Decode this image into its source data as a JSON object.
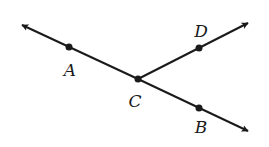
{
  "diagram": {
    "colors": {
      "stroke": "#1a1a1a",
      "background": "#ffffff"
    },
    "points": [
      {
        "id": "A",
        "label": "A",
        "x": 69,
        "y": 47,
        "label_x": 70,
        "label_y": 70
      },
      {
        "id": "C",
        "label": "C",
        "x": 138,
        "y": 79,
        "label_x": 135,
        "label_y": 101
      },
      {
        "id": "D",
        "label": "D",
        "x": 199,
        "y": 48,
        "label_x": 201,
        "label_y": 31
      },
      {
        "id": "B",
        "label": "B",
        "x": 199,
        "y": 108,
        "label_x": 201,
        "label_y": 127
      }
    ],
    "rays": [
      {
        "from": "C",
        "through": "A",
        "arrow_tip": [
          20,
          24
        ]
      },
      {
        "from": "C",
        "through": "D",
        "arrow_tip": [
          250,
          22
        ]
      },
      {
        "from": "C",
        "through": "B",
        "arrow_tip": [
          250,
          132
        ]
      }
    ]
  }
}
